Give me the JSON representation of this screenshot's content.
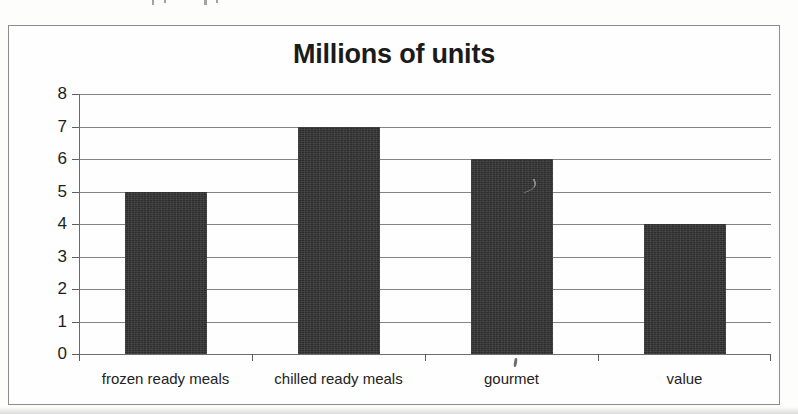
{
  "chart_data": {
    "type": "bar",
    "title": "Millions of units",
    "xlabel": "",
    "ylabel": "",
    "categories": [
      "frozen ready meals",
      "chilled ready meals",
      "gourmet",
      "value"
    ],
    "values": [
      5,
      7,
      6,
      4
    ],
    "series": [
      {
        "name": "Millions of units",
        "values": [
          5,
          7,
          6,
          4
        ]
      }
    ],
    "ylim": [
      0,
      8
    ],
    "ytick_labels": [
      "0",
      "1",
      "2",
      "3",
      "4",
      "5",
      "6",
      "7",
      "8"
    ],
    "ytick_values": [
      0,
      1,
      2,
      3,
      4,
      5,
      6,
      7,
      8
    ],
    "ytick_step": 1,
    "grid": true,
    "grid_axis": "y",
    "legend": false,
    "legend_position": "none",
    "bar_color": "#2e2e2e",
    "gridline_color": "#6f6f6f",
    "axis_color": "#6a6a6a",
    "text_color": "#1d1d1d",
    "background_color": "#fefefe",
    "frame_border_color": "#8d8d8d"
  }
}
